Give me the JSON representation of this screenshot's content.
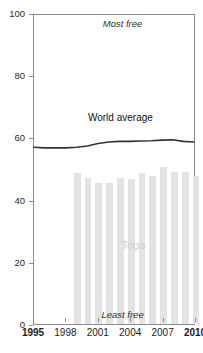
{
  "chart_data": {
    "type": "bar",
    "title": "Economic freedom over time",
    "xlabel": "",
    "ylabel": "",
    "ylim": [
      0,
      100
    ],
    "xlim": [
      1995,
      2010
    ],
    "ytick_labels": [
      "0",
      "20",
      "40",
      "60",
      "80",
      "100"
    ],
    "ytick_values": [
      0,
      20,
      40,
      60,
      80,
      100
    ],
    "xtick_labels": [
      "1995",
      "1998",
      "2001",
      "2004",
      "2007",
      "2010"
    ],
    "xtick_values": [
      1995,
      1998,
      2001,
      2004,
      2007,
      2010
    ],
    "xtick_bold": [
      "1995",
      "2010"
    ],
    "grid": false,
    "legend_position": "inline-annotations",
    "annotations": [
      {
        "text": "Most free",
        "x": 2003.2,
        "y": 97,
        "style": "italic"
      },
      {
        "text": "Least free",
        "x": 2003.2,
        "y": 3.5,
        "style": "italic"
      },
      {
        "text": "World average",
        "x": 2003.0,
        "y": 67,
        "style": "plain"
      },
      {
        "text": "Togo",
        "x": 2004.2,
        "y": 26,
        "style": "plain"
      }
    ],
    "series": [
      {
        "name": "Togo",
        "type": "bar",
        "color": "#e3e3e3",
        "x": [
          1999,
          2000,
          2001,
          2002,
          2003,
          2004,
          2005,
          2006,
          2007,
          2008,
          2009,
          2010
        ],
        "values": [
          48.5,
          47.0,
          45.5,
          45.5,
          47.0,
          46.5,
          48.5,
          47.5,
          50.5,
          49.0,
          49.0,
          47.5
        ]
      },
      {
        "name": "World average",
        "type": "line",
        "color": "#333333",
        "x": [
          1995,
          1996,
          1997,
          1998,
          1999,
          2000,
          2001,
          2002,
          2003,
          2004,
          2005,
          2006,
          2007,
          2008,
          2009,
          2010
        ],
        "values": [
          57.2,
          57.0,
          57.0,
          57.0,
          57.2,
          57.6,
          58.4,
          58.9,
          59.1,
          59.1,
          59.2,
          59.3,
          59.5,
          59.6,
          59.1,
          58.9
        ]
      }
    ]
  }
}
